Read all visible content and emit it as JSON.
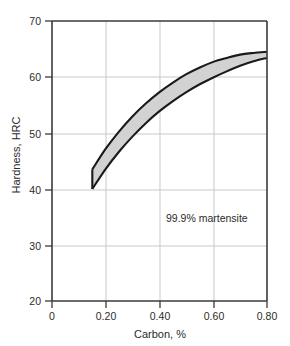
{
  "chart_data": {
    "type": "area",
    "title": "",
    "subtitle": "",
    "xlabel": "Carbon, %",
    "ylabel": "Hardness, HRC",
    "xlim": [
      0,
      0.8
    ],
    "ylim": [
      20,
      70
    ],
    "xticks": [
      0,
      0.2,
      0.4,
      0.6,
      0.8
    ],
    "xtick_labels": [
      "0",
      "0.20",
      "0.40",
      "0.60",
      "0.80"
    ],
    "yticks": [
      20,
      30,
      40,
      50,
      60,
      70
    ],
    "ytick_labels": [
      "20",
      "30",
      "40",
      "50",
      "60",
      "70"
    ],
    "grid": true,
    "grid_color": "#c9c9c9",
    "legend": "none",
    "annotations": [
      {
        "text": "99.9% martensite",
        "x": 0.47,
        "y": 34.2
      }
    ],
    "band": {
      "name": "99.9% martensite hardness band",
      "fill_color": "#d2d2d2",
      "edge_color": "#1a1a1a",
      "x": [
        0.15,
        0.2,
        0.25,
        0.3,
        0.35,
        0.4,
        0.45,
        0.5,
        0.55,
        0.6,
        0.65,
        0.7,
        0.75,
        0.8
      ],
      "upper": [
        43.5,
        47.2,
        50.3,
        53.0,
        55.3,
        57.3,
        59.0,
        60.5,
        61.7,
        62.7,
        63.4,
        64.0,
        64.3,
        64.5
      ],
      "lower": [
        40.0,
        43.6,
        46.7,
        49.4,
        51.8,
        53.9,
        55.7,
        57.3,
        58.7,
        59.9,
        61.0,
        62.0,
        62.8,
        63.4
      ]
    }
  },
  "figure": {
    "background": "#ffffff",
    "axis_color": "#3a3a3a"
  }
}
